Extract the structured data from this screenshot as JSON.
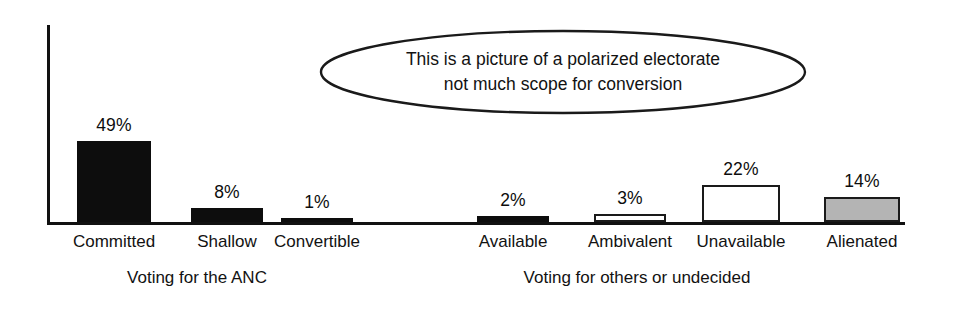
{
  "chart_data": {
    "type": "bar",
    "title": "",
    "xlabel": "",
    "ylabel": "",
    "ylim": [
      0,
      60
    ],
    "grid": false,
    "legend": "none",
    "categories": [
      "Committed",
      "Shallow",
      "Convertible",
      "Available",
      "Ambivalent",
      "Unavailable",
      "Alienated"
    ],
    "values": [
      49,
      8,
      1,
      2,
      3,
      22,
      14
    ],
    "value_labels": [
      "49%",
      "8%",
      "1%",
      "2%",
      "3%",
      "22%",
      "14%"
    ],
    "bar_styles": [
      "solid",
      "solid",
      "solid",
      "solid",
      "hollow",
      "hollow",
      "gray"
    ],
    "groups": [
      {
        "label": "Voting for the ANC",
        "categories": [
          "Committed",
          "Shallow",
          "Convertible"
        ]
      },
      {
        "label": "Voting for others or undecided",
        "categories": [
          "Available",
          "Ambivalent",
          "Unavailable",
          "Alienated"
        ]
      }
    ],
    "annotations": [
      {
        "type": "ellipse-callout",
        "line1": "This is a picture of a polarized electorate",
        "line2": "not much scope for conversion"
      }
    ],
    "colors": {
      "solid": "#0d0d0d",
      "hollow": "#ffffff",
      "gray": "#b4b4b4",
      "outline": "#1a1a1a",
      "axis": "#111111",
      "text": "#121212"
    }
  },
  "bars": [
    {
      "label": "Committed",
      "value_label": "49%",
      "left": 77,
      "width": 74,
      "height": 81,
      "style": "solid"
    },
    {
      "label": "Shallow",
      "value_label": "8%",
      "left": 191,
      "width": 72,
      "height": 14,
      "style": "solid"
    },
    {
      "label": "Convertible",
      "value_label": "1%",
      "left": 281,
      "width": 72,
      "height": 4,
      "style": "solid"
    },
    {
      "label": "Available",
      "value_label": "2%",
      "left": 477,
      "width": 72,
      "height": 6,
      "style": "solid"
    },
    {
      "label": "Ambivalent",
      "value_label": "3%",
      "left": 594,
      "width": 72,
      "height": 8,
      "style": "hollow"
    },
    {
      "label": "Unavailable",
      "value_label": "22%",
      "left": 702,
      "width": 78,
      "height": 37,
      "style": "hollow"
    },
    {
      "label": "Alienated",
      "value_label": "14%",
      "left": 824,
      "width": 76,
      "height": 25,
      "style": "gray"
    }
  ],
  "groups": [
    {
      "label": "Voting for the ANC",
      "center": 197
    },
    {
      "label": "Voting for others or undecided",
      "center": 637
    }
  ],
  "callout": {
    "line1": "This is a picture of a polarized electorate",
    "line2": "not much scope for conversion"
  }
}
